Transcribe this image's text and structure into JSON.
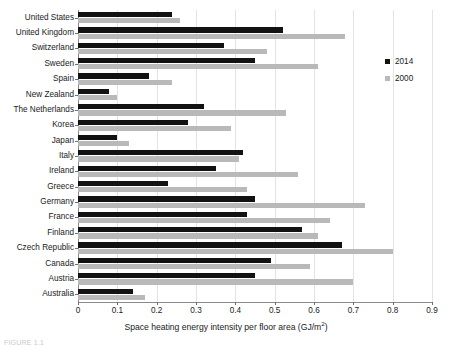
{
  "chart_data": {
    "type": "bar",
    "orientation": "horizontal",
    "title": "",
    "xlabel": "Space heating energy intensity per floor area (GJ/m²)",
    "ylabel": "",
    "xlim": [
      0,
      0.9
    ],
    "xticks": [
      "0",
      "0.1",
      "0.2",
      "0.3",
      "0.4",
      "0.5",
      "0.6",
      "0.7",
      "0.8",
      "0.9"
    ],
    "grid": true,
    "legend_position": "right",
    "categories": [
      "United States",
      "United Kingdom",
      "Switzerland",
      "Sweden",
      "Spain",
      "New Zealand",
      "The Netherlands",
      "Korea",
      "Japan",
      "Italy",
      "Ireland",
      "Greece",
      "Germany",
      "France",
      "Finland",
      "Czech Republic",
      "Canada",
      "Austria",
      "Australia"
    ],
    "series": [
      {
        "name": "2014",
        "color": "#121212",
        "values": [
          0.24,
          0.52,
          0.37,
          0.45,
          0.18,
          0.08,
          0.32,
          0.28,
          0.1,
          0.42,
          0.35,
          0.23,
          0.45,
          0.43,
          0.57,
          0.67,
          0.49,
          0.45,
          0.14
        ]
      },
      {
        "name": "2000",
        "color": "#b9b9b9",
        "values": [
          0.26,
          0.68,
          0.48,
          0.61,
          0.24,
          0.1,
          0.53,
          0.39,
          0.13,
          0.41,
          0.56,
          0.43,
          0.73,
          0.64,
          0.61,
          0.8,
          0.59,
          0.7,
          0.17
        ]
      }
    ]
  },
  "legend": {
    "items": [
      {
        "label": "2014",
        "color": "#121212"
      },
      {
        "label": "2000",
        "color": "#b9b9b9"
      }
    ]
  },
  "axis": {
    "title_main": "Space heating energy intensity per floor area (GJ/m",
    "title_sup": "2",
    "title_tail": ")"
  },
  "caption": {
    "text": "FIGURE 1.1"
  }
}
